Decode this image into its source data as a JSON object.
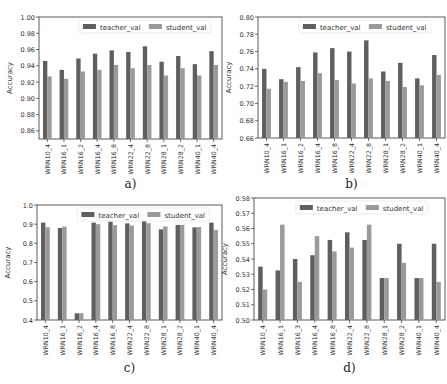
{
  "colors": {
    "teacher": "#5f5f5f",
    "student": "#9a9a9a",
    "axis": "#333333",
    "text": "#333333"
  },
  "legend": {
    "teacher": "teacher_val",
    "student": "student_val"
  },
  "chart_data": [
    {
      "id": "a",
      "caption": "a)",
      "type": "bar",
      "ylabel": "Accuracy",
      "ylim": [
        0.85,
        1.0
      ],
      "yticks": [
        0.86,
        0.88,
        0.9,
        0.92,
        0.94,
        0.96,
        0.98,
        1.0
      ],
      "ytick_fmt": 2,
      "categories": [
        "WRN10_4",
        "WRN16_1",
        "WRN16_2",
        "WRN16_4",
        "WRN16_8",
        "WRN22_4",
        "WRN22_8",
        "WRN28_1",
        "WRN28_2",
        "WRN40_1",
        "WRN40_4"
      ],
      "series": [
        {
          "name": "teacher_val",
          "values": [
            0.946,
            0.935,
            0.949,
            0.955,
            0.959,
            0.957,
            0.964,
            0.945,
            0.952,
            0.942,
            0.958
          ]
        },
        {
          "name": "student_val",
          "values": [
            0.927,
            0.924,
            0.933,
            0.935,
            0.941,
            0.937,
            0.941,
            0.928,
            0.937,
            0.928,
            0.941
          ]
        }
      ],
      "box": {
        "x": 0,
        "y": 0,
        "w": 224,
        "h": 192,
        "pl": 39,
        "pt": 17,
        "pr": 222,
        "pb": 139
      }
    },
    {
      "id": "b",
      "caption": "b)",
      "type": "bar",
      "ylabel": "Accuracy",
      "ylim": [
        0.66,
        0.8
      ],
      "yticks": [
        0.66,
        0.68,
        0.7,
        0.72,
        0.74,
        0.76,
        0.78,
        0.8
      ],
      "ytick_fmt": 2,
      "categories": [
        "WRN10_4",
        "WRN16_1",
        "WRN16_2",
        "WRN16_4",
        "WRN16_8",
        "WRN22_4",
        "WRN22_8",
        "WRN28_1",
        "WRN28_2",
        "WRN40_1",
        "WRN40_4"
      ],
      "series": [
        {
          "name": "teacher_val",
          "values": [
            0.74,
            0.728,
            0.742,
            0.759,
            0.764,
            0.76,
            0.773,
            0.737,
            0.747,
            0.729,
            0.756
          ]
        },
        {
          "name": "student_val",
          "values": [
            0.717,
            0.725,
            0.726,
            0.735,
            0.727,
            0.723,
            0.729,
            0.726,
            0.719,
            0.721,
            0.733
          ]
        }
      ],
      "box": {
        "x": 224,
        "y": 0,
        "w": 223,
        "h": 192,
        "pl": 258,
        "pt": 17,
        "pr": 445,
        "pb": 138
      }
    },
    {
      "id": "c",
      "caption": "c)",
      "type": "bar",
      "ylabel": "Accuracy",
      "ylim": [
        0.4,
        1.0
      ],
      "yticks": [
        0.4,
        0.5,
        0.6,
        0.7,
        0.8,
        0.9,
        1.0
      ],
      "ytick_fmt": 1,
      "categories": [
        "WRN10_4",
        "WRN16_1",
        "WRN16_2",
        "WRN16_4",
        "WRN16_8",
        "WRN22_4",
        "WRN22_8",
        "WRN28_1",
        "WRN28_2",
        "WRN40_1",
        "WRN40_4"
      ],
      "series": [
        {
          "name": "teacher_val",
          "values": [
            0.908,
            0.88,
            0.435,
            0.908,
            0.913,
            0.904,
            0.915,
            0.873,
            0.896,
            0.883,
            0.908
          ]
        },
        {
          "name": "student_val",
          "values": [
            0.884,
            0.888,
            0.435,
            0.9,
            0.895,
            0.893,
            0.905,
            0.888,
            0.896,
            0.885,
            0.87
          ]
        }
      ],
      "box": {
        "x": 0,
        "y": 192,
        "w": 224,
        "h": 192,
        "pl": 37,
        "pt": 205,
        "pr": 222,
        "pb": 320
      }
    },
    {
      "id": "d",
      "caption": "d)",
      "type": "bar",
      "ylabel": "Accuracy",
      "ylim": [
        0.5,
        0.58
      ],
      "yticks": [
        0.5,
        0.51,
        0.52,
        0.53,
        0.54,
        0.55,
        0.56,
        0.57,
        0.58
      ],
      "ytick_fmt": 2,
      "categories": [
        "WRN10_4",
        "WRN16_1",
        "WRN16_3",
        "WRN16_4",
        "WRN16_8",
        "WRN22_4",
        "WRN22_8",
        "WRN28_1",
        "WRN28_2",
        "WRN40_1",
        "WRN40_4"
      ],
      "series": [
        {
          "name": "teacher_val",
          "values": [
            0.535,
            0.5325,
            0.54,
            0.5425,
            0.5525,
            0.5575,
            0.5525,
            0.5275,
            0.55,
            0.5275,
            0.55
          ]
        },
        {
          "name": "student_val",
          "values": [
            0.52,
            0.5625,
            0.525,
            0.555,
            0.545,
            0.5475,
            0.5625,
            0.5275,
            0.5375,
            0.5275,
            0.525
          ]
        }
      ],
      "box": {
        "x": 224,
        "y": 192,
        "w": 223,
        "h": 192,
        "pl": 254,
        "pt": 198,
        "pr": 445,
        "pb": 320
      }
    }
  ]
}
